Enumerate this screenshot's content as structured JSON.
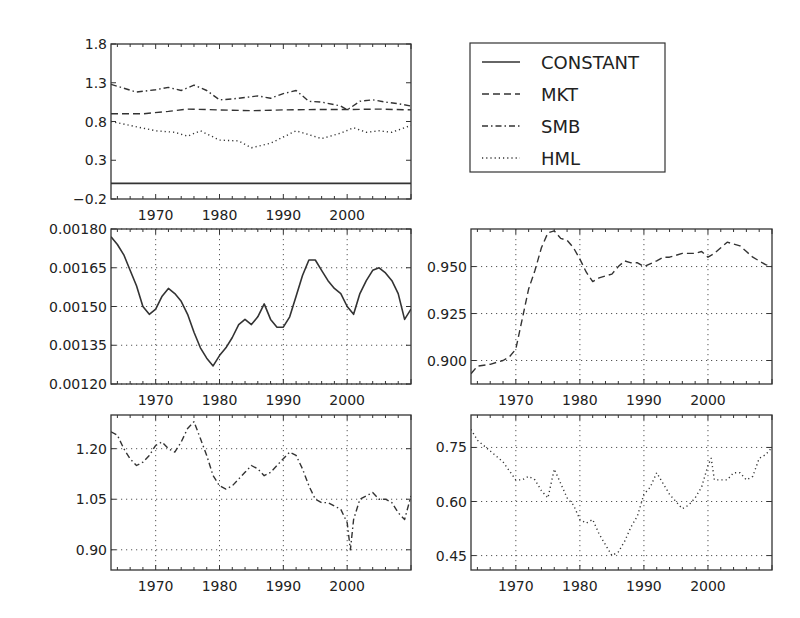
{
  "chart_data": [
    {
      "id": "combined",
      "type": "line",
      "title": "",
      "xlabel": "",
      "ylabel": "",
      "xlim": [
        1963,
        2010
      ],
      "ylim": [
        -0.2,
        1.8
      ],
      "yticks": [
        "-0.2",
        "0.3",
        "0.8",
        "1.3",
        "1.8"
      ],
      "ytick_values": [
        -0.2,
        0.3,
        0.8,
        1.3,
        1.8
      ],
      "xticks": [
        "1970",
        "1980",
        "1990",
        "2000"
      ],
      "grid": false,
      "legend_position": "right (separate box)",
      "series": [
        {
          "name": "CONSTANT",
          "style": "solid",
          "x": [
            1963,
            2010
          ],
          "y": [
            0.0015,
            0.0015
          ]
        },
        {
          "name": "MKT",
          "style": "dashed",
          "x": [
            1963,
            1968,
            1972,
            1975,
            1980,
            1985,
            1990,
            1995,
            2000,
            2005,
            2010
          ],
          "y": [
            0.9,
            0.9,
            0.93,
            0.96,
            0.95,
            0.94,
            0.95,
            0.955,
            0.955,
            0.96,
            0.95
          ]
        },
        {
          "name": "SMB",
          "style": "dashdot",
          "x": [
            1963,
            1965,
            1967,
            1970,
            1972,
            1974,
            1976,
            1978,
            1980,
            1982,
            1986,
            1988,
            1990,
            1992,
            1994,
            1996,
            1999,
            2000,
            2002,
            2004,
            2006,
            2008,
            2010
          ],
          "y": [
            1.28,
            1.23,
            1.18,
            1.21,
            1.24,
            1.2,
            1.27,
            1.2,
            1.08,
            1.09,
            1.13,
            1.1,
            1.16,
            1.2,
            1.06,
            1.05,
            1.0,
            0.95,
            1.06,
            1.08,
            1.05,
            1.03,
            1.0
          ]
        },
        {
          "name": "HML",
          "style": "dotted",
          "x": [
            1963,
            1966,
            1970,
            1973,
            1975,
            1977,
            1980,
            1983,
            1985,
            1988,
            1990,
            1992,
            1996,
            1999,
            2001,
            2003,
            2005,
            2007,
            2010
          ],
          "y": [
            0.8,
            0.75,
            0.68,
            0.66,
            0.61,
            0.68,
            0.56,
            0.55,
            0.46,
            0.52,
            0.6,
            0.68,
            0.58,
            0.65,
            0.72,
            0.66,
            0.68,
            0.66,
            0.75
          ]
        }
      ]
    },
    {
      "id": "constant",
      "type": "line",
      "title": "",
      "xlabel": "",
      "ylabel": "",
      "xlim": [
        1963,
        2010
      ],
      "ylim": [
        0.0012,
        0.0018
      ],
      "yticks": [
        "0.00120",
        "0.00135",
        "0.00150",
        "0.00165",
        "0.00180"
      ],
      "ytick_values": [
        0.0012,
        0.00135,
        0.0015,
        0.00165,
        0.0018
      ],
      "xticks": [
        "1970",
        "1980",
        "1990",
        "2000"
      ],
      "grid": true,
      "series": [
        {
          "name": "CONSTANT",
          "style": "solid",
          "x": [
            1963,
            1964,
            1965,
            1966,
            1967,
            1968,
            1969,
            1970,
            1971,
            1972,
            1973,
            1974,
            1975,
            1976,
            1977,
            1978,
            1979,
            1980,
            1981,
            1982,
            1983,
            1984,
            1985,
            1986,
            1987,
            1988,
            1989,
            1990,
            1991,
            1992,
            1993,
            1994,
            1995,
            1996,
            1997,
            1998,
            1999,
            2000,
            2001,
            2002,
            2003,
            2004,
            2005,
            2006,
            2007,
            2008,
            2009,
            2010
          ],
          "y": [
            0.00177,
            0.00174,
            0.0017,
            0.00164,
            0.00158,
            0.0015,
            0.00147,
            0.00149,
            0.00154,
            0.00157,
            0.00155,
            0.00152,
            0.00147,
            0.0014,
            0.00134,
            0.0013,
            0.00127,
            0.00131,
            0.00134,
            0.00138,
            0.00143,
            0.00145,
            0.00143,
            0.00146,
            0.00151,
            0.00145,
            0.00142,
            0.00142,
            0.00146,
            0.00154,
            0.00162,
            0.00168,
            0.00168,
            0.00164,
            0.0016,
            0.00157,
            0.00155,
            0.0015,
            0.00147,
            0.00155,
            0.0016,
            0.00164,
            0.00165,
            0.00163,
            0.0016,
            0.00155,
            0.00145,
            0.00149
          ]
        }
      ]
    },
    {
      "id": "mkt",
      "type": "line",
      "title": "",
      "xlabel": "",
      "ylabel": "",
      "xlim": [
        1963,
        2010
      ],
      "ylim": [
        0.8875,
        0.97
      ],
      "yticks": [
        "0.900",
        "0.925",
        "0.950"
      ],
      "ytick_values": [
        0.9,
        0.925,
        0.95
      ],
      "xticks": [
        "1970",
        "1980",
        "1990",
        "2000"
      ],
      "grid": true,
      "series": [
        {
          "name": "MKT",
          "style": "dashed",
          "x": [
            1963,
            1964,
            1966,
            1968,
            1969,
            1970,
            1971,
            1972,
            1973,
            1974,
            1975,
            1976,
            1977,
            1978,
            1979,
            1980,
            1981,
            1982,
            1983,
            1985,
            1986,
            1987,
            1988,
            1989,
            1990,
            1992,
            1993,
            1994,
            1996,
            1998,
            1999,
            2000,
            2001,
            2002,
            2003,
            2004,
            2005,
            2006,
            2007,
            2008,
            2009,
            2010
          ],
          "y": [
            0.893,
            0.897,
            0.898,
            0.9,
            0.902,
            0.906,
            0.922,
            0.938,
            0.948,
            0.96,
            0.968,
            0.969,
            0.965,
            0.964,
            0.96,
            0.954,
            0.947,
            0.942,
            0.944,
            0.946,
            0.95,
            0.953,
            0.952,
            0.952,
            0.95,
            0.953,
            0.955,
            0.955,
            0.957,
            0.957,
            0.958,
            0.955,
            0.957,
            0.96,
            0.963,
            0.962,
            0.961,
            0.958,
            0.955,
            0.953,
            0.951,
            0.95
          ]
        }
      ]
    },
    {
      "id": "smb",
      "type": "line",
      "title": "",
      "xlabel": "",
      "ylabel": "",
      "xlim": [
        1963,
        2010
      ],
      "ylim": [
        0.84,
        1.3
      ],
      "yticks": [
        "0.90",
        "1.05",
        "1.20"
      ],
      "ytick_values": [
        0.9,
        1.05,
        1.2
      ],
      "xticks": [
        "1970",
        "1980",
        "1990",
        "2000"
      ],
      "grid": true,
      "series": [
        {
          "name": "SMB",
          "style": "dashdot",
          "x": [
            1963,
            1964,
            1965,
            1966,
            1967,
            1968,
            1969,
            1970,
            1971,
            1972,
            1973,
            1974,
            1975,
            1976,
            1977,
            1978,
            1979,
            1980,
            1981,
            1982,
            1983,
            1984,
            1985,
            1986,
            1987,
            1988,
            1989,
            1990,
            1991,
            1992,
            1993,
            1994,
            1995,
            1996,
            1997,
            1998,
            1999,
            2000,
            2000.5,
            2001,
            2002,
            2003,
            2004,
            2005,
            2006,
            2007,
            2008,
            2009,
            2010
          ],
          "y": [
            1.25,
            1.24,
            1.2,
            1.17,
            1.15,
            1.16,
            1.18,
            1.21,
            1.22,
            1.2,
            1.19,
            1.22,
            1.26,
            1.28,
            1.23,
            1.18,
            1.12,
            1.09,
            1.08,
            1.09,
            1.11,
            1.13,
            1.15,
            1.14,
            1.12,
            1.13,
            1.15,
            1.17,
            1.19,
            1.18,
            1.14,
            1.09,
            1.05,
            1.04,
            1.04,
            1.03,
            1.02,
            0.98,
            0.9,
            0.99,
            1.05,
            1.06,
            1.07,
            1.05,
            1.05,
            1.04,
            1.01,
            0.99,
            1.06
          ]
        }
      ]
    },
    {
      "id": "hml",
      "type": "line",
      "title": "",
      "xlabel": "",
      "ylabel": "",
      "xlim": [
        1963,
        2010
      ],
      "ylim": [
        0.41,
        0.84
      ],
      "yticks": [
        "0.45",
        "0.60",
        "0.75"
      ],
      "ytick_values": [
        0.45,
        0.6,
        0.75
      ],
      "xticks": [
        "1970",
        "1980",
        "1990",
        "2000"
      ],
      "grid": true,
      "series": [
        {
          "name": "HML",
          "style": "dotted",
          "x": [
            1963,
            1964,
            1966,
            1968,
            1970,
            1971,
            1972,
            1973,
            1974,
            1975,
            1976,
            1977,
            1978,
            1979,
            1980,
            1981,
            1982,
            1983,
            1984,
            1985,
            1986,
            1987,
            1988,
            1989,
            1990,
            1991,
            1992,
            1993,
            1994,
            1995,
            1996,
            1997,
            1998,
            1999,
            2000,
            2000.5,
            2001,
            2002,
            2003,
            2004,
            2005,
            2006,
            2007,
            2008,
            2009,
            2010
          ],
          "y": [
            0.8,
            0.77,
            0.74,
            0.71,
            0.66,
            0.66,
            0.67,
            0.66,
            0.63,
            0.61,
            0.69,
            0.65,
            0.61,
            0.59,
            0.55,
            0.54,
            0.55,
            0.51,
            0.48,
            0.45,
            0.46,
            0.49,
            0.53,
            0.56,
            0.62,
            0.64,
            0.68,
            0.65,
            0.62,
            0.6,
            0.58,
            0.59,
            0.61,
            0.64,
            0.7,
            0.72,
            0.66,
            0.66,
            0.66,
            0.68,
            0.68,
            0.66,
            0.67,
            0.72,
            0.73,
            0.75
          ]
        }
      ]
    }
  ],
  "legend": {
    "entries": [
      {
        "label": "CONSTANT",
        "style": "solid"
      },
      {
        "label": "MKT",
        "style": "dashed"
      },
      {
        "label": "SMB",
        "style": "dashdot"
      },
      {
        "label": "HML",
        "style": "dotted"
      }
    ]
  },
  "colors": {
    "line": "#333333",
    "axis": "#333333",
    "grid": "#555555",
    "background": "#ffffff"
  }
}
